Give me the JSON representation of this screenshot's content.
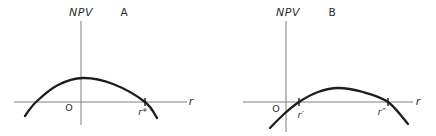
{
  "colors": {
    "background": "#ffffff",
    "curve": "#1d1d1d",
    "axis": "#7e7e7e",
    "tick": "#1d1d1d",
    "text": "#2b2b2b"
  },
  "chart_data": [
    {
      "type": "line",
      "panel_label": "A",
      "ylabel": "NPV",
      "xlabel": "r",
      "origin_label": "O",
      "x_intercept_labels": [
        "r*"
      ],
      "axes": {
        "vertical": {
          "x": 81,
          "y1": 21,
          "y2": 125
        },
        "horizontal": {
          "y": 102,
          "x1": 14,
          "x2": 187
        }
      },
      "series": [
        {
          "name": "npv-curve-a",
          "points": [
            [
              25,
              116
            ],
            [
              36,
              102
            ],
            [
              58,
              85
            ],
            [
              83,
              78
            ],
            [
              113,
              84
            ],
            [
              145,
              102
            ],
            [
              157,
              118
            ]
          ]
        }
      ],
      "intercept_ticks": [
        [
          145,
          102
        ]
      ],
      "label_positions": {
        "ylabel": [
          81,
          12
        ],
        "panel": [
          124,
          12
        ],
        "origin": [
          69,
          108
        ],
        "xlabel": [
          191,
          101
        ],
        "intercept_0": [
          143,
          112
        ]
      }
    },
    {
      "type": "line",
      "panel_label": "B",
      "ylabel": "NPV",
      "xlabel": "r",
      "origin_label": "O",
      "x_intercept_labels": [
        "r′",
        "r″"
      ],
      "axes": {
        "vertical": {
          "x": 286,
          "y1": 21,
          "y2": 132
        },
        "horizontal": {
          "y": 102,
          "x1": 243,
          "x2": 413
        }
      },
      "series": [
        {
          "name": "npv-curve-b",
          "points": [
            [
              270,
              128
            ],
            [
              284,
              114
            ],
            [
              299,
              102
            ],
            [
              318,
              92
            ],
            [
              338,
              88
            ],
            [
              363,
              92
            ],
            [
              388,
              102
            ],
            [
              408,
              124
            ]
          ]
        }
      ],
      "intercept_ticks": [
        [
          299,
          102
        ],
        [
          388,
          102
        ]
      ],
      "label_positions": {
        "ylabel": [
          288,
          12
        ],
        "panel": [
          332,
          12
        ],
        "origin": [
          276,
          109
        ],
        "xlabel": [
          418,
          101
        ],
        "intercept_0": [
          301,
          115
        ],
        "intercept_1": [
          382,
          112
        ]
      }
    }
  ]
}
